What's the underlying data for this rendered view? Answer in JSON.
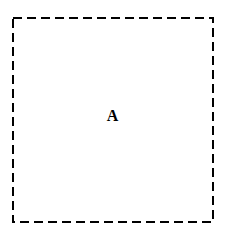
{
  "canvas": {
    "width": 229,
    "height": 236,
    "background_color": "#ffffff"
  },
  "diagram": {
    "type": "region-outline",
    "title": "",
    "shapes": [
      {
        "name": "region-A",
        "kind": "rectangle",
        "stroke_style": "dashed",
        "stroke_color": "#000000",
        "stroke_width": 2.5,
        "dash_length": 9,
        "dash_gap": 5,
        "fill": "none",
        "x": 13,
        "y": 18,
        "width": 200,
        "height": 204
      }
    ],
    "labels": [
      {
        "name": "region-label-a",
        "text": "A",
        "color": "#000000",
        "font_size": 16,
        "font_weight": "bold",
        "font_style": "serif",
        "center_x": 111,
        "center_y": 116
      }
    ]
  }
}
